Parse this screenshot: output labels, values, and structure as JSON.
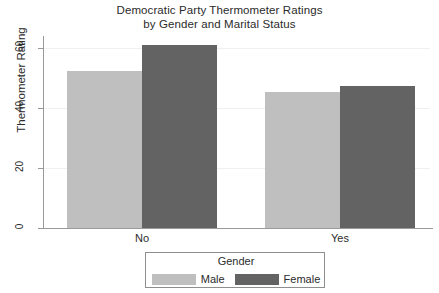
{
  "chart_data": {
    "type": "bar",
    "title": "Democratic Party Thermometer Ratings",
    "subtitle": "by Gender and Marital Status",
    "xlabel": "",
    "ylabel": "Thermometer Rating",
    "categories": [
      "No",
      "Yes"
    ],
    "series": [
      {
        "name": "Male",
        "values": [
          52.5,
          45.5
        ],
        "color": "#bfbfbf"
      },
      {
        "name": "Female",
        "values": [
          61.0,
          47.5
        ],
        "color": "#636363"
      }
    ],
    "ylim": [
      0,
      66
    ],
    "yticks": [
      0,
      20,
      40,
      60
    ],
    "ytick_labels": [
      "0",
      "20",
      "40",
      "60"
    ],
    "grid": true,
    "legend": {
      "title": "Gender",
      "position": "bottom",
      "entries": [
        {
          "label": "Male",
          "color": "#bfbfbf"
        },
        {
          "label": "Female",
          "color": "#636363"
        }
      ]
    },
    "axis_color": "#9a9a9a",
    "grid_color": "#f0f0f0",
    "text_color": "#2b2b2b",
    "background": "#ffffff"
  },
  "geometry": {
    "baseline_y": 228,
    "px_per_unit": 3.0,
    "bar_width": 75,
    "group_starts": [
      67,
      265
    ]
  }
}
